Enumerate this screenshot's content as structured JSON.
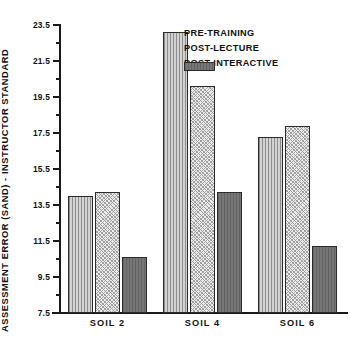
{
  "chart_data": {
    "type": "bar",
    "title": "",
    "xlabel": "",
    "ylabel": "ASSESSMENT ERROR (SAND) - INSTRUCTOR STANDARD",
    "categories": [
      "SOIL 2",
      "SOIL 4",
      "SOIL 6"
    ],
    "series": [
      {
        "name": "PRE-TRAINING",
        "values": [
          14.0,
          23.1,
          17.3
        ],
        "pattern": "vertical-stripes",
        "color": "#b9b9b9"
      },
      {
        "name": "POST-LECTURE",
        "values": [
          14.2,
          20.1,
          17.9
        ],
        "pattern": "light-stipple",
        "color": "#ebebeb"
      },
      {
        "name": "POST-INTERACTIVE",
        "values": [
          10.6,
          14.2,
          11.2
        ],
        "pattern": "solid-dark",
        "color": "#6e6e6e"
      }
    ],
    "ylim": [
      7.5,
      23.5
    ],
    "yticks": [
      7.5,
      9.5,
      11.5,
      13.5,
      15.5,
      17.5,
      19.5,
      21.5,
      23.5
    ],
    "ytick_labels": [
      "7.5",
      "9.5",
      "11.5",
      "13.5",
      "15.5",
      "17.5",
      "19.5",
      "21.5",
      "23.5"
    ],
    "minor_ticks": [
      8.5,
      10.5,
      12.5,
      14.5,
      16.5,
      18.5,
      20.5,
      22.5
    ],
    "grid": false,
    "legend_position": "top-right"
  }
}
